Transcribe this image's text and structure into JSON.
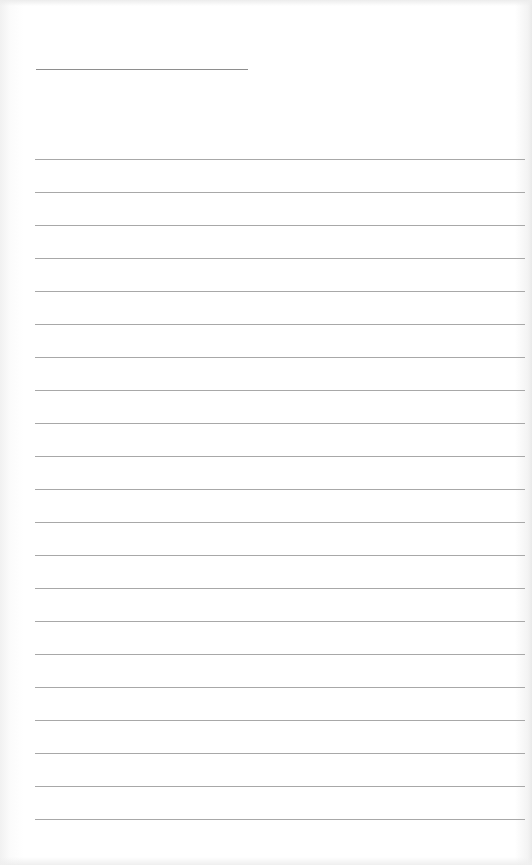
{
  "page": {
    "type": "blank ruled sheet",
    "title_line": {
      "x": 36,
      "y": 69,
      "width": 212
    },
    "ruled_lines": {
      "count": 21,
      "first_y": 159,
      "spacing": 33,
      "x": 35,
      "width": 490
    },
    "colors": {
      "paper": "#ffffff",
      "line": "#a8a8a8",
      "title_line": "#8e8e8e"
    }
  }
}
